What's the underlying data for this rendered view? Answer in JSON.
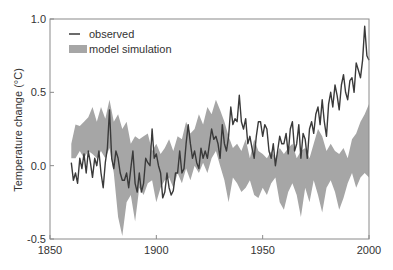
{
  "chart_data": {
    "type": "line",
    "title": "",
    "xlabel": "",
    "ylabel": "Temperature change (°C)",
    "xlim": [
      1850,
      2000
    ],
    "ylim": [
      -0.5,
      1.0
    ],
    "xticks": [
      1850,
      1900,
      1950,
      2000
    ],
    "xtick_labels": [
      "1850",
      "1900",
      "1950",
      "2000"
    ],
    "yticks": [
      -0.5,
      0.0,
      0.5,
      1.0
    ],
    "ytick_labels": [
      "-0.5",
      "0.0",
      "0.5",
      "1.0"
    ],
    "grid": false,
    "legend_position": "upper left",
    "legend": [
      {
        "label": "observed",
        "style": "line",
        "color": "#3a3a3a"
      },
      {
        "label": "model simulation",
        "style": "band",
        "color": "#a6a6a6"
      }
    ],
    "series": [
      {
        "name": "observed",
        "type": "line",
        "color": "#3a3a3a",
        "start_year": 1860,
        "values": [
          0.02,
          -0.1,
          -0.05,
          -0.12,
          0.05,
          -0.02,
          0.08,
          -0.05,
          0.1,
          0.02,
          -0.08,
          0.05,
          0.0,
          0.1,
          -0.05,
          -0.15,
          0.02,
          0.12,
          0.38,
          0.05,
          -0.02,
          0.1,
          0.05,
          -0.05,
          -0.1,
          -0.1,
          -0.05,
          -0.15,
          -0.02,
          0.1,
          -0.12,
          -0.18,
          -0.05,
          -0.18,
          -0.12,
          0.05,
          0.02,
          0.0,
          0.25,
          0.05,
          0.08,
          0.0,
          -0.05,
          -0.22,
          -0.18,
          -0.05,
          -0.15,
          -0.2,
          -0.17,
          -0.05,
          -0.05,
          0.1,
          -0.05,
          -0.02,
          0.15,
          0.28,
          0.15,
          0.05,
          0.1,
          0.02,
          -0.02,
          0.12,
          0.05,
          0.1,
          0.05,
          0.15,
          0.25,
          0.18,
          0.2,
          0.15,
          0.05,
          0.28,
          0.15,
          0.1,
          0.2,
          0.4,
          0.28,
          0.32,
          0.3,
          0.48,
          0.3,
          0.25,
          0.32,
          0.15,
          0.2,
          0.12,
          0.05,
          0.2,
          0.3,
          0.3,
          0.2,
          0.28,
          0.25,
          0.1,
          0.05,
          0.15,
          0.0,
          0.1,
          0.2,
          0.15,
          0.15,
          0.22,
          0.08,
          0.25,
          0.3,
          0.1,
          0.15,
          0.28,
          0.05,
          0.22,
          0.18,
          0.05,
          0.25,
          0.3,
          0.22,
          0.35,
          0.4,
          0.28,
          0.45,
          0.3,
          0.2,
          0.42,
          0.5,
          0.4,
          0.55,
          0.48,
          0.38,
          0.55,
          0.62,
          0.5,
          0.45,
          0.58,
          0.6,
          0.5,
          0.7,
          0.65,
          0.6,
          0.72,
          0.95,
          0.75,
          0.72
        ]
      },
      {
        "name": "model simulation",
        "type": "area",
        "color": "#a6a6a6",
        "start_year": 1860,
        "step": 2,
        "upper": [
          0.15,
          0.28,
          0.27,
          0.3,
          0.33,
          0.4,
          0.3,
          0.4,
          0.32,
          0.45,
          0.3,
          0.35,
          0.25,
          0.3,
          0.15,
          0.2,
          0.18,
          0.2,
          0.22,
          0.1,
          0.15,
          0.08,
          0.12,
          0.18,
          0.1,
          0.2,
          0.18,
          0.3,
          0.22,
          0.25,
          0.35,
          0.28,
          0.4,
          0.35,
          0.45,
          0.38,
          0.3,
          0.2,
          0.12,
          0.15,
          0.1,
          0.18,
          0.05,
          0.18,
          0.1,
          0.08,
          0.05,
          0.1,
          0.05,
          0.12,
          0.08,
          0.12,
          0.15,
          0.05,
          0.1,
          0.12,
          0.05,
          0.15,
          0.25,
          0.2,
          0.1,
          0.15,
          0.1,
          0.08,
          0.12,
          0.05,
          0.18,
          0.22,
          0.3,
          0.35,
          0.42
        ],
        "lower": [
          0.05,
          0.05,
          0.1,
          0.05,
          0.1,
          0.08,
          0.05,
          0.1,
          0.05,
          0.12,
          -0.05,
          -0.35,
          -0.48,
          -0.25,
          -0.2,
          -0.38,
          -0.15,
          -0.2,
          -0.12,
          -0.1,
          -0.25,
          -0.15,
          -0.1,
          -0.08,
          -0.15,
          -0.05,
          -0.12,
          -0.02,
          -0.1,
          0.0,
          -0.05,
          0.02,
          -0.05,
          0.05,
          0.1,
          0.0,
          -0.1,
          -0.25,
          -0.08,
          -0.12,
          -0.18,
          -0.15,
          -0.1,
          -0.2,
          -0.22,
          -0.15,
          -0.2,
          -0.12,
          -0.08,
          -0.25,
          -0.3,
          -0.18,
          -0.12,
          -0.2,
          -0.35,
          -0.15,
          -0.25,
          -0.1,
          -0.2,
          -0.32,
          -0.15,
          -0.1,
          -0.18,
          -0.3,
          -0.22,
          -0.12,
          -0.05,
          -0.15,
          -0.08,
          -0.05,
          -0.08
        ]
      }
    ]
  }
}
